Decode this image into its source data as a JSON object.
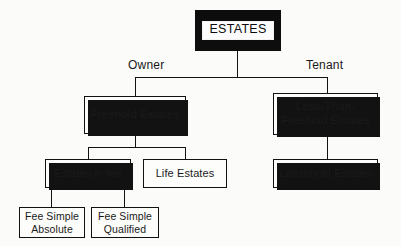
{
  "diagram": {
    "title": "Estates",
    "type": "hierarchy-tree",
    "background_color": "#fbfbfa",
    "line_color": "#121212",
    "root_fill_color": "#0d0d0d",
    "root_text_color": "#0a0a0a",
    "box_border_color": "#111111",
    "box_fill_color": "#fdfdfc"
  },
  "root": {
    "label": "ESTATES"
  },
  "branch_labels": {
    "owner": "Owner",
    "tenant": "Tenant"
  },
  "nodes": {
    "freehold": {
      "label": "Freehold Estates"
    },
    "less_than_freehold": {
      "line1": "Less-Than-",
      "line2": "Freehold Estates"
    },
    "estates_in_fee": {
      "label": "Estates in fee"
    },
    "life_estates": {
      "label": "Life Estates"
    },
    "leasehold": {
      "label": "Leasehold Estates"
    },
    "fee_simple_absolute": {
      "line1": "Fee Simple",
      "line2": "Absolute"
    },
    "fee_simple_qualified": {
      "line1": "Fee Simple",
      "line2": "Qualified"
    }
  }
}
